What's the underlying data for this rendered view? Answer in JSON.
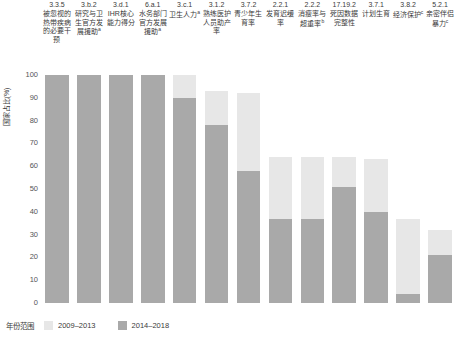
{
  "chart_data": {
    "type": "bar",
    "stacked": true,
    "title": "",
    "subtitle": "",
    "xlabel": "",
    "ylabel": "国家占比(%)",
    "ylim": [
      0,
      100
    ],
    "yticks": [
      100,
      90,
      80,
      70,
      60,
      50,
      40,
      30,
      20,
      10,
      0
    ],
    "grid": false,
    "legend": {
      "title": "年份范围",
      "position": "bottom-left",
      "entries": [
        {
          "name": "2009–2013",
          "color": "#e7e7e7"
        },
        {
          "name": "2014–2018",
          "color": "#a9a9a9"
        }
      ]
    },
    "categories": [
      {
        "code": "3.3.5",
        "label": "被忽视的热带疾病的必要干预",
        "superscript": ""
      },
      {
        "code": "3.b.2",
        "label": "研究与卫生官方发展援助",
        "superscript": "a"
      },
      {
        "code": "3.d.1",
        "label": "IHR核心能力得分",
        "superscript": ""
      },
      {
        "code": "6.a.1",
        "label": "水务部门官方发展援助",
        "superscript": "a"
      },
      {
        "code": "3.c.1",
        "label": "卫生人力",
        "superscript": "a"
      },
      {
        "code": "3.1.2",
        "label": "熟练医护人员助产率",
        "superscript": ""
      },
      {
        "code": "3.7.2",
        "label": "青少年生育率",
        "superscript": ""
      },
      {
        "code": "2.2.1",
        "label": "发育迟缓率",
        "superscript": ""
      },
      {
        "code": "2.2.2",
        "label": "消瘦率与超重率",
        "superscript": "b"
      },
      {
        "code": "17.19.2",
        "label": "死因数据完整性",
        "superscript": ""
      },
      {
        "code": "3.7.1",
        "label": "计划生育",
        "superscript": ""
      },
      {
        "code": "3.8.2",
        "label": "经济保护",
        "superscript": "c"
      },
      {
        "code": "5.2.1",
        "label": "亲密伴侣暴力",
        "superscript": "c"
      }
    ],
    "series": [
      {
        "name": "2014–2018",
        "color": "#a9a9a9",
        "values": [
          100,
          100,
          100,
          100,
          90,
          78,
          58,
          37,
          37,
          51,
          40,
          4,
          21
        ]
      },
      {
        "name": "2009–2013",
        "color": "#e7e7e7",
        "note": "cumulative top of stack (total coverage)",
        "totals": [
          100,
          100,
          100,
          100,
          100,
          93,
          92,
          64,
          64,
          64,
          63,
          37,
          32
        ]
      }
    ]
  }
}
